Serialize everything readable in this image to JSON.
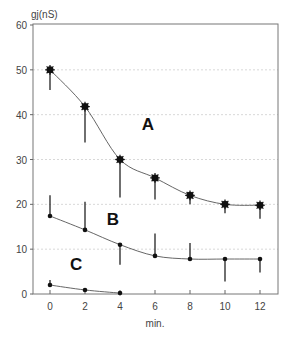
{
  "chart_data": {
    "type": "line",
    "title": "",
    "xlabel": "min.",
    "ylabel": "gj(nS)",
    "xlim": [
      -1,
      13
    ],
    "ylim": [
      0,
      60
    ],
    "x_ticks": [
      0,
      2,
      4,
      6,
      8,
      10,
      12
    ],
    "y_ticks": [
      0,
      10,
      20,
      30,
      40,
      50,
      60
    ],
    "grid": "horizontal dotted",
    "legend": "none (inline labels A, B, C)",
    "x": [
      0,
      2,
      4,
      6,
      8,
      10,
      12
    ],
    "series": [
      {
        "name": "A",
        "marker": "star",
        "values": [
          50,
          41.8,
          30,
          25.9,
          22,
          20,
          19.8
        ],
        "error_direction": "down",
        "error": [
          4.5,
          8,
          8.5,
          4.8,
          2,
          2,
          3
        ]
      },
      {
        "name": "B",
        "marker": "dot",
        "values": [
          17.4,
          14.3,
          11,
          8.5,
          7.8,
          7.8,
          7.8
        ],
        "error_direction": [
          "up",
          "up",
          "down",
          "up",
          "up",
          "down",
          "down"
        ],
        "error": [
          4.6,
          6.3,
          4.5,
          5,
          3.6,
          5,
          3
        ]
      },
      {
        "name": "C",
        "marker": "dot",
        "values": [
          2,
          0.9,
          0.2
        ],
        "x": [
          0,
          2,
          4
        ],
        "error_direction": "up",
        "error": [
          1.1,
          0,
          0
        ]
      }
    ],
    "annotations": [
      "A",
      "B",
      "C"
    ]
  }
}
